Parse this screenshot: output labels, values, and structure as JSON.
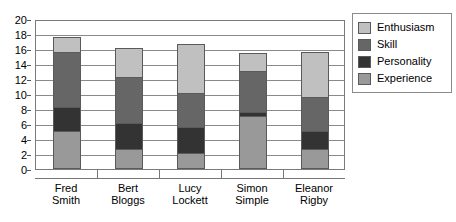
{
  "chart_data": {
    "type": "bar",
    "stacked": true,
    "title": "",
    "xlabel": "",
    "ylabel": "",
    "ylim": [
      0,
      20
    ],
    "ytick_step": 2,
    "yticks": [
      0,
      2,
      4,
      6,
      8,
      10,
      12,
      14,
      16,
      18,
      20
    ],
    "grid": true,
    "legend_position": "right",
    "categories": [
      "Fred Smith",
      "Bert Bloggs",
      "Lucy Lockett",
      "Simon Simple",
      "Eleanor Rigby"
    ],
    "category_lines": [
      [
        "Fred",
        "Smith"
      ],
      [
        "Bert",
        "Bloggs"
      ],
      [
        "Lucy",
        "Lockett"
      ],
      [
        "Simon",
        "Simple"
      ],
      [
        "Eleanor",
        "Rigby"
      ]
    ],
    "series": [
      {
        "name": "Experience",
        "color": "#999999",
        "values": [
          5,
          2.5,
          2,
          7,
          2.5
        ]
      },
      {
        "name": "Personality",
        "color": "#333333",
        "values": [
          3.2,
          3.5,
          3.5,
          0.5,
          2.5
        ]
      },
      {
        "name": "Skill",
        "color": "#666666",
        "values": [
          7.3,
          6.2,
          4.5,
          5.5,
          4.5
        ]
      },
      {
        "name": "Enthusiasm",
        "color": "#c0c0c0",
        "values": [
          2,
          3.8,
          6.5,
          2.3,
          6
        ]
      }
    ],
    "totals": [
      17.5,
      16,
      16.5,
      15.3,
      15.5
    ],
    "legend_entries": [
      {
        "label": "Enthusiasm",
        "color": "#c0c0c0"
      },
      {
        "label": "Skill",
        "color": "#666666"
      },
      {
        "label": "Personality",
        "color": "#333333"
      },
      {
        "label": "Experience",
        "color": "#999999"
      }
    ]
  }
}
